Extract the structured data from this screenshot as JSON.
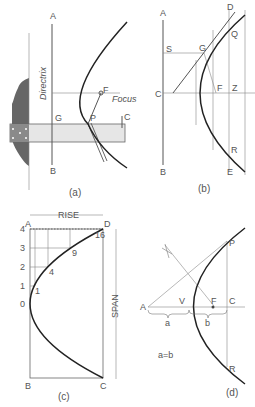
{
  "panels": {
    "a": {
      "caption": "(a)",
      "labels": {
        "A": "A",
        "B": "B",
        "G": "G",
        "P": "P",
        "F": "F",
        "C": "C",
        "directrix": "Directrix",
        "focus": "Focus"
      }
    },
    "b": {
      "caption": "(b)",
      "labels": {
        "A": "A",
        "B": "B",
        "C": "C",
        "S": "S",
        "G": "G",
        "F": "F",
        "Z": "Z",
        "D": "D",
        "Q": "Q",
        "R": "R",
        "E": "E"
      }
    },
    "c": {
      "caption": "(c)",
      "labels": {
        "A": "A",
        "B": "B",
        "C": "C",
        "D": "D",
        "rise": "RISE",
        "span": "SPAN"
      },
      "left_ticks": [
        "4",
        "3",
        "2",
        "1",
        "0"
      ],
      "point_labels": [
        "16",
        "9",
        "4",
        "1"
      ]
    },
    "d": {
      "caption": "(d)",
      "labels": {
        "A": "A",
        "V": "V",
        "F": "F",
        "C": "C",
        "P": "P",
        "R": "R",
        "a": "a",
        "b": "b"
      },
      "equation": "a=b"
    }
  }
}
